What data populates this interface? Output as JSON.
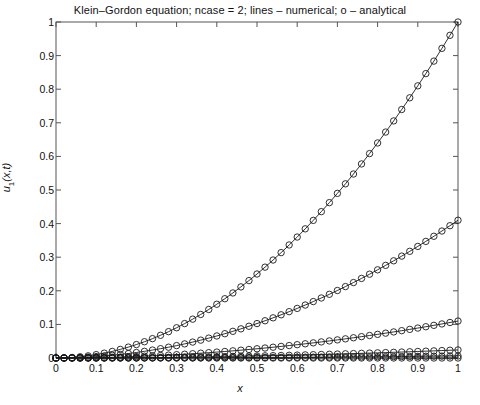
{
  "figure": {
    "title": "Klein–Gordon equation; ncase = 2; lines – numerical; o – analytical",
    "xlabel": "x",
    "ylabel_main": "u",
    "ylabel_sub": "1",
    "ylabel_args": "(x,t)",
    "background": "#ffffff",
    "axis_color": "#555555",
    "curve_color": "#1a1a1a"
  },
  "chart_data": {
    "type": "line",
    "title": "Klein–Gordon equation; ncase = 2; lines – numerical; o – analytical",
    "xlabel": "x",
    "ylabel": "u_1(x,t)",
    "xlim": [
      0,
      1
    ],
    "ylim": [
      0,
      1
    ],
    "grid": false,
    "legend": "none",
    "marker": "o",
    "marker_style": "open-circle",
    "line_style": "solid",
    "xticks": [
      0,
      0.1,
      0.2,
      0.3,
      0.4,
      0.5,
      0.6,
      0.7,
      0.8,
      0.9,
      1
    ],
    "xtick_labels": [
      "0",
      "0.1",
      "0.2",
      "0.3",
      "0.4",
      "0.5",
      "0.6",
      "0.7",
      "0.8",
      "0.9",
      "1"
    ],
    "yticks": [
      0,
      0.1,
      0.2,
      0.3,
      0.4,
      0.5,
      0.6,
      0.7,
      0.8,
      0.9,
      1
    ],
    "ytick_labels": [
      "0",
      "0.1",
      "0.2",
      "0.3",
      "0.4",
      "0.5",
      "0.6",
      "0.7",
      "0.8",
      "0.9",
      "1"
    ],
    "x": [
      0,
      0.02,
      0.04,
      0.06,
      0.08,
      0.1,
      0.12,
      0.14,
      0.16,
      0.18,
      0.2,
      0.22,
      0.24,
      0.26,
      0.28,
      0.3,
      0.32,
      0.34,
      0.36,
      0.38,
      0.4,
      0.42,
      0.44,
      0.46,
      0.48,
      0.5,
      0.52,
      0.54,
      0.56,
      0.58,
      0.6,
      0.62,
      0.64,
      0.66,
      0.68,
      0.7,
      0.72,
      0.74,
      0.76,
      0.78,
      0.8,
      0.82,
      0.84,
      0.86,
      0.88,
      0.9,
      0.92,
      0.94,
      0.96,
      0.98,
      1
    ],
    "series": [
      {
        "name": "t = t5",
        "endpoint": 1.0,
        "values": [
          0,
          0.0004,
          0.0016,
          0.0036,
          0.0064,
          0.01,
          0.0144,
          0.0196,
          0.0256,
          0.0324,
          0.04,
          0.0484,
          0.0576,
          0.0676,
          0.0784,
          0.09,
          0.1024,
          0.1156,
          0.1296,
          0.1444,
          0.16,
          0.1764,
          0.1936,
          0.2116,
          0.2304,
          0.25,
          0.2704,
          0.2916,
          0.3136,
          0.3364,
          0.36,
          0.3844,
          0.4096,
          0.4356,
          0.4624,
          0.49,
          0.5184,
          0.5476,
          0.5776,
          0.6084,
          0.64,
          0.6724,
          0.7056,
          0.7396,
          0.7744,
          0.81,
          0.8464,
          0.8836,
          0.9216,
          0.9604,
          1.0
        ]
      },
      {
        "name": "t = t4",
        "endpoint": 0.41,
        "values": [
          0,
          0.00016,
          0.00066,
          0.00148,
          0.00262,
          0.0041,
          0.0059,
          0.00804,
          0.0105,
          0.01328,
          0.0164,
          0.01984,
          0.02362,
          0.02772,
          0.03214,
          0.0369,
          0.042,
          0.04739,
          0.05314,
          0.05921,
          0.0656,
          0.07232,
          0.07938,
          0.08676,
          0.09446,
          0.1025,
          0.11086,
          0.11956,
          0.12858,
          0.13792,
          0.1476,
          0.1576,
          0.16794,
          0.1786,
          0.18958,
          0.2009,
          0.21254,
          0.22452,
          0.23682,
          0.24944,
          0.2624,
          0.27568,
          0.2893,
          0.30324,
          0.3175,
          0.3321,
          0.34702,
          0.36228,
          0.37786,
          0.39376,
          0.41
        ]
      },
      {
        "name": "t = t3",
        "endpoint": 0.11,
        "values": [
          0,
          4.4e-05,
          0.000176,
          0.000396,
          0.000704,
          0.0011,
          0.001584,
          0.002156,
          0.002816,
          0.003564,
          0.0044,
          0.005324,
          0.006336,
          0.007436,
          0.008624,
          0.0099,
          0.011264,
          0.012716,
          0.014256,
          0.015884,
          0.0176,
          0.019404,
          0.021296,
          0.023276,
          0.025344,
          0.0275,
          0.029744,
          0.032076,
          0.034496,
          0.037004,
          0.0396,
          0.042284,
          0.045056,
          0.047916,
          0.050864,
          0.0539,
          0.057024,
          0.060236,
          0.063536,
          0.066924,
          0.0704,
          0.073964,
          0.077616,
          0.081356,
          0.085184,
          0.0891,
          0.093104,
          0.097196,
          0.101376,
          0.105644,
          0.11
        ]
      },
      {
        "name": "t = t2",
        "endpoint": 0.024,
        "values": [
          0,
          9.6e-06,
          3.84e-05,
          8.64e-05,
          0.0001536,
          0.00024,
          0.0003456,
          0.0004704,
          0.0006144,
          0.0007776,
          0.00096,
          0.0011616,
          0.0013824,
          0.0016224,
          0.0018816,
          0.00216,
          0.0024576,
          0.0027744,
          0.0031104,
          0.0034656,
          0.00384,
          0.0042336,
          0.0046464,
          0.0050784,
          0.0055296,
          0.006,
          0.0064896,
          0.0069984,
          0.0075264,
          0.0080736,
          0.00864,
          0.0092256,
          0.0098304,
          0.0104544,
          0.0110976,
          0.01176,
          0.0124416,
          0.0131424,
          0.0138624,
          0.0146016,
          0.01536,
          0.0161376,
          0.0169344,
          0.0177504,
          0.0185856,
          0.01944,
          0.0203136,
          0.0212064,
          0.0221184,
          0.0230496,
          0.024
        ]
      },
      {
        "name": "t = t1",
        "endpoint": 0.006,
        "values": [
          0,
          2.4e-06,
          9.6e-06,
          2.16e-05,
          3.84e-05,
          6e-05,
          8.64e-05,
          0.0001176,
          0.0001536,
          0.0001944,
          0.00024,
          0.0002904,
          0.0003456,
          0.0004056,
          0.0004704,
          0.00054,
          0.0006144,
          0.0006936,
          0.0007776,
          0.0008664,
          0.00096,
          0.0010584,
          0.0011616,
          0.0012696,
          0.0013824,
          0.0015,
          0.0016224,
          0.0017496,
          0.0018816,
          0.0020184,
          0.00216,
          0.0023064,
          0.0024576,
          0.0026136,
          0.0027744,
          0.00294,
          0.0031104,
          0.0032856,
          0.0034656,
          0.0036504,
          0.00384,
          0.0040344,
          0.0042336,
          0.0044376,
          0.0046464,
          0.00486,
          0.0050784,
          0.0053016,
          0.0055296,
          0.0057624,
          0.006
        ]
      },
      {
        "name": "t = t0",
        "endpoint": 0.0,
        "values": [
          0,
          0,
          0,
          0,
          0,
          0,
          0,
          0,
          0,
          0,
          0,
          0,
          0,
          0,
          0,
          0,
          0,
          0,
          0,
          0,
          0,
          0,
          0,
          0,
          0,
          0,
          0,
          0,
          0,
          0,
          0,
          0,
          0,
          0,
          0,
          0,
          0,
          0,
          0,
          0,
          0,
          0,
          0,
          0,
          0,
          0,
          0,
          0,
          0,
          0,
          0
        ]
      }
    ]
  }
}
